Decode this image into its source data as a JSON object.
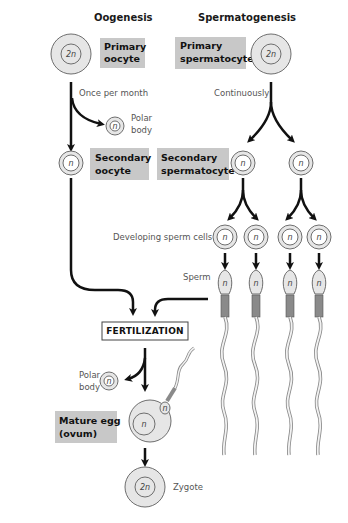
{
  "columns": {
    "left_title": "Oogenesis",
    "right_title": "Spermatogenesis"
  },
  "labels": {
    "primary_oocyte": [
      "Primary",
      "oocyte"
    ],
    "primary_spermatocyte": [
      "Primary",
      "spermatocyte"
    ],
    "secondary_oocyte": [
      "Secondary",
      "oocyte"
    ],
    "secondary_spermatocyte": [
      "Secondary",
      "spermatocyte"
    ],
    "mature_egg": [
      "Mature egg",
      "(ovum)"
    ],
    "once_per_month": "Once per month",
    "continuously": "Continuously",
    "polar_body_1": [
      "Polar",
      "body"
    ],
    "polar_body_2": [
      "Polar",
      "body"
    ],
    "developing_sperm": "Developing sperm cells",
    "sperm": "Sperm",
    "fertilization": "FERTILIZATION",
    "zygote": "Zygote"
  },
  "ploidy": {
    "diploid": "2n",
    "haploid": "n"
  },
  "colors": {
    "label_box": "#c8c8c8",
    "cell_fill": "#e6e6e6",
    "cell_stroke": "#6e6e6e",
    "arrow": "#111111"
  }
}
